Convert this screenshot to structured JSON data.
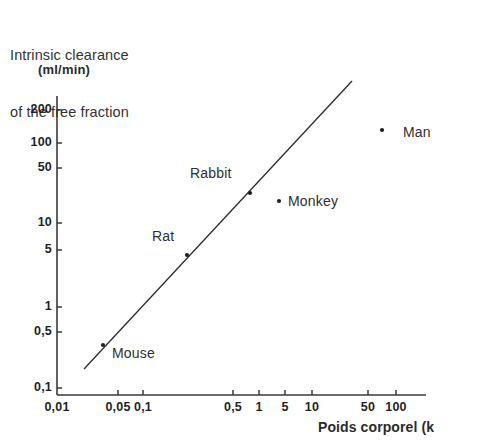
{
  "figure": {
    "title_lines": [
      "Intrinsic clearance",
      "of the free fraction"
    ],
    "background_color": "#ffffff",
    "ink_color": "#2b2b2b"
  },
  "axes": {
    "y_unit_label": "(ml/min)",
    "x_title": "Poids corporel (k",
    "y_ticks": [
      {
        "label": "200",
        "y": 110
      },
      {
        "label": "100",
        "y": 143
      },
      {
        "label": "50",
        "y": 168
      },
      {
        "label": "10",
        "y": 223
      },
      {
        "label": "5",
        "y": 250
      },
      {
        "label": "1",
        "y": 307
      },
      {
        "label": "0,5",
        "y": 332
      },
      {
        "label": "0,1",
        "y": 388
      }
    ],
    "x_ticks": [
      {
        "label": "0,01",
        "x": 57
      },
      {
        "label": "0,05",
        "x": 118
      },
      {
        "label": "0,1",
        "x": 143
      },
      {
        "label": "0,5",
        "x": 233
      },
      {
        "label": "1",
        "x": 259
      },
      {
        "label": "5",
        "x": 285
      },
      {
        "label": "10",
        "x": 312
      },
      {
        "label": "50",
        "x": 368
      },
      {
        "label": "100",
        "x": 396
      }
    ]
  },
  "chart_data": {
    "type": "scatter",
    "title": "Intrinsic clearance of the free fraction",
    "xlabel": "Poids corporel (kg)",
    "ylabel": "(ml/min)",
    "xscale": "log",
    "yscale": "log",
    "xlim": [
      0.01,
      200
    ],
    "ylim": [
      0.1,
      300
    ],
    "grid": false,
    "legend": "none",
    "x_tick_values": [
      0.01,
      0.05,
      0.1,
      0.5,
      1,
      5,
      10,
      50,
      100
    ],
    "y_tick_values": [
      0.1,
      0.5,
      1,
      5,
      10,
      50,
      100,
      200
    ],
    "points": [
      {
        "name": "Mouse",
        "x": 0.025,
        "y": 0.4,
        "px": 103,
        "py": 345,
        "label_px": 112,
        "label_py": 345,
        "label_anchor": "left"
      },
      {
        "name": "Rat",
        "x": 0.3,
        "y": 5,
        "px": 187,
        "py": 255,
        "label_px": 152,
        "label_py": 228,
        "label_anchor": "left"
      },
      {
        "name": "Rabbit",
        "x": 2.5,
        "y": 35,
        "px": 250,
        "py": 193,
        "label_px": 190,
        "label_py": 165,
        "label_anchor": "left"
      },
      {
        "name": "Monkey",
        "x": 4.0,
        "y": 25,
        "px": 279,
        "py": 201,
        "label_px": 288,
        "label_py": 193,
        "label_anchor": "left"
      },
      {
        "name": "Man",
        "x": 70,
        "y": 130,
        "px": 382,
        "py": 130,
        "label_px": 403,
        "label_py": 124,
        "label_anchor": "left"
      }
    ],
    "regression_line": {
      "description": "allometric fit line through species points",
      "x_start": 0.018,
      "y_start": 0.22,
      "x_end": 40,
      "y_end": 320,
      "px_start": 84,
      "py_start": 369,
      "px_end": 352,
      "py_end": 81
    }
  }
}
